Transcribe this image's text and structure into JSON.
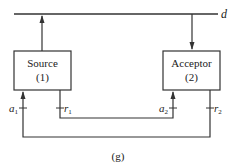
{
  "diagram": {
    "bus_label": "d",
    "source": {
      "title": "Source",
      "number": "(1)"
    },
    "acceptor": {
      "title": "Acceptor",
      "number": "(2)"
    },
    "ports": {
      "a1": {
        "base": "a",
        "sub": "1"
      },
      "r1": {
        "base": "r",
        "sub": "1"
      },
      "a2": {
        "base": "a",
        "sub": "2"
      },
      "r2": {
        "base": "r",
        "sub": "2"
      }
    },
    "caption": "(g)"
  }
}
